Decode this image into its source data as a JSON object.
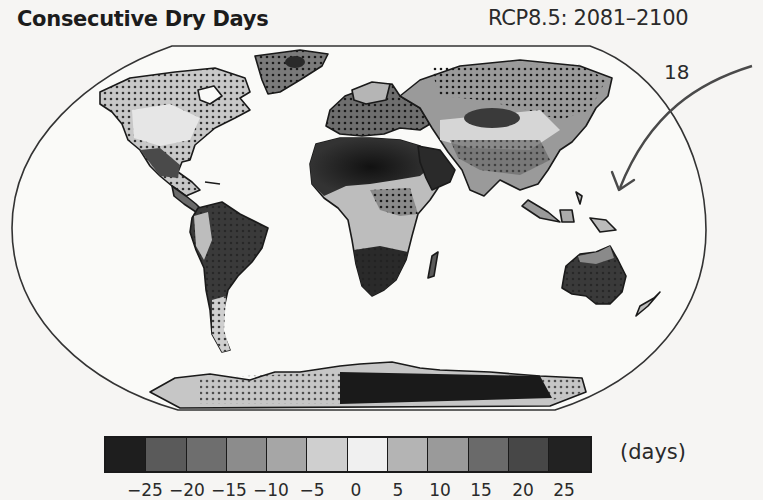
{
  "figure": {
    "title": "Consecutive Dry Days",
    "scenario": "RCP8.5: 2081–2100",
    "annotation_number": "18",
    "annotation_arrow": "curved arrow pointing toward western Pacific / Southeast Asia"
  },
  "colorbar": {
    "units": "(days)",
    "ticks": [
      "−25",
      "−20",
      "−15",
      "−10",
      "−5",
      "0",
      "5",
      "10",
      "15",
      "20",
      "25"
    ],
    "bins": [
      {
        "range": "< -25",
        "color": "#1e1e1e"
      },
      {
        "range": "-25 to -20",
        "color": "#5a5a5a"
      },
      {
        "range": "-20 to -15",
        "color": "#6e6e6e"
      },
      {
        "range": "-15 to -10",
        "color": "#8c8c8c"
      },
      {
        "range": "-10 to -5",
        "color": "#a6a6a6"
      },
      {
        "range": "-5 to 0",
        "color": "#cfcfcf"
      },
      {
        "range": "0 to 5",
        "color": "#f0f0f0"
      },
      {
        "range": "5 to 10",
        "color": "#b4b4b4"
      },
      {
        "range": "10 to 15",
        "color": "#9a9a9a"
      },
      {
        "range": "15 to 20",
        "color": "#6a6a6a"
      },
      {
        "range": "20 to 25",
        "color": "#474747"
      },
      {
        "range": "> 25",
        "color": "#222222"
      }
    ]
  },
  "map": {
    "projection": "Robinson-like world map",
    "stippling": "dots indicate significant / robust change",
    "regions": [
      {
        "name": "North America",
        "pattern": "light to mid gray, stippled north, darker in Mexico/SW US"
      },
      {
        "name": "South America",
        "pattern": "dark (drier) in Amazon/Brazil, stippled"
      },
      {
        "name": "North Africa / Sahara",
        "pattern": "very dark, large increase"
      },
      {
        "name": "Southern Africa",
        "pattern": "very dark, stippled"
      },
      {
        "name": "Europe / Mediterranean",
        "pattern": "dark, stippled"
      },
      {
        "name": "Siberia / N Asia",
        "pattern": "stippled mid gray with dark core in central Asia"
      },
      {
        "name": "Australia",
        "pattern": "dark, stippled"
      },
      {
        "name": "Antarctica",
        "pattern": "very dark in East Antarctica"
      }
    ]
  }
}
